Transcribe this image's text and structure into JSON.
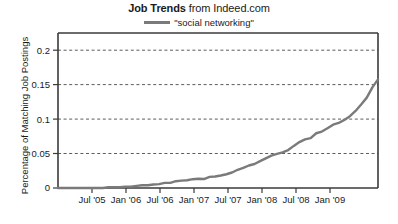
{
  "chart_data": {
    "type": "line",
    "title": "Job Trends from Indeed.com",
    "title_strong": "Job Trends",
    "title_rest": " from Indeed.com",
    "source": "Indeed.com",
    "xlabel": "",
    "ylabel": "Percentage of Matching Job Postings",
    "legend": [
      {
        "name": "\"social networking\"",
        "color": "#7a7a7a"
      }
    ],
    "legend_position": "top-center",
    "grid": "horizontal-dashed",
    "ylim": [
      0,
      0.225
    ],
    "yticks": [
      0,
      0.05,
      0.1,
      0.15,
      0.2
    ],
    "ytick_labels": [
      "0",
      "0.05",
      "0.1",
      "0.15",
      "0.2"
    ],
    "xlim": [
      "2005-01",
      "2009-10"
    ],
    "xticks": [
      "2005-07",
      "2006-01",
      "2006-07",
      "2007-01",
      "2007-07",
      "2008-01",
      "2008-07",
      "2009-01"
    ],
    "xtick_labels": [
      "Jul '05",
      "Jan '06",
      "Jul '06",
      "Jan '07",
      "Jul '07",
      "Jan '08",
      "Jul '08",
      "Jan '09"
    ],
    "series": [
      {
        "name": "\"social networking\"",
        "color": "#7a7a7a",
        "x": [
          "2005-01",
          "2005-02",
          "2005-03",
          "2005-04",
          "2005-05",
          "2005-06",
          "2005-07",
          "2005-08",
          "2005-09",
          "2005-10",
          "2005-11",
          "2005-12",
          "2006-01",
          "2006-02",
          "2006-03",
          "2006-04",
          "2006-05",
          "2006-06",
          "2006-07",
          "2006-08",
          "2006-09",
          "2006-10",
          "2006-11",
          "2006-12",
          "2007-01",
          "2007-02",
          "2007-03",
          "2007-04",
          "2007-05",
          "2007-06",
          "2007-07",
          "2007-08",
          "2007-09",
          "2007-10",
          "2007-11",
          "2007-12",
          "2008-01",
          "2008-02",
          "2008-03",
          "2008-04",
          "2008-05",
          "2008-06",
          "2008-07",
          "2008-08",
          "2008-09",
          "2008-10",
          "2008-11",
          "2008-12",
          "2009-01",
          "2009-02",
          "2009-03",
          "2009-04",
          "2009-05",
          "2009-06",
          "2009-07",
          "2009-08",
          "2009-09",
          "2009-10"
        ],
        "values": [
          0.0,
          0.0,
          0.0,
          0.0,
          0.0,
          0.0,
          0.0,
          0.0,
          0.0,
          0.001,
          0.001,
          0.001,
          0.002,
          0.002,
          0.003,
          0.004,
          0.004,
          0.005,
          0.006,
          0.007,
          0.008,
          0.01,
          0.011,
          0.011,
          0.012,
          0.013,
          0.013,
          0.015,
          0.016,
          0.018,
          0.021,
          0.023,
          0.026,
          0.029,
          0.032,
          0.035,
          0.04,
          0.044,
          0.047,
          0.05,
          0.052,
          0.056,
          0.061,
          0.066,
          0.071,
          0.073,
          0.079,
          0.082,
          0.086,
          0.091,
          0.094,
          0.098,
          0.105,
          0.112,
          0.121,
          0.132,
          0.146,
          0.157
        ]
      }
    ],
    "value_at_end": 0.157,
    "peak_value": 0.157,
    "units": "percent of matching job postings"
  }
}
